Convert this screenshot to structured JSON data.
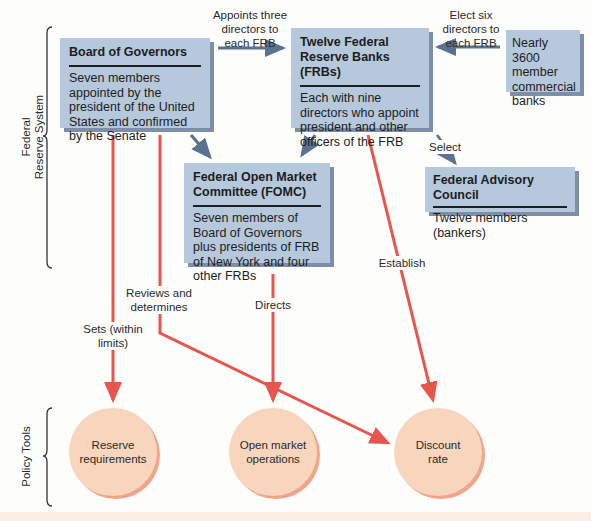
{
  "brackets": {
    "federal_reserve_system": {
      "line1": "Federal",
      "line2": "Reserve System"
    },
    "policy_tools": "Policy Tools"
  },
  "boxes": {
    "board_of_governors": {
      "title": "Board of Governors",
      "description": "Seven members appointed by the president of the United States and confirmed by the Senate"
    },
    "frbs": {
      "title": "Twelve Federal Reserve Banks (FRBs)",
      "description": "Each with nine directors who appoint president and other officers of the FRB"
    },
    "member_banks": {
      "description": "Nearly 3600 member commercial banks"
    },
    "fomc": {
      "title": "Federal Open Market Committee (FOMC)",
      "description": "Seven members of Board of Governors plus presidents of FRB of New York and four other FRBs"
    },
    "advisory_council": {
      "title": "Federal Advisory Council",
      "description": "Twelve members (bankers)"
    }
  },
  "edge_labels": {
    "appoints": "Appoints three directors to each FRB",
    "elect": "Elect six directors to each FRB",
    "select": "Select",
    "establish": "Establish",
    "reviews": "Reviews and determines",
    "directs": "Directs",
    "sets": "Sets (within limits)"
  },
  "policy_tools": [
    {
      "label": "Reserve requirements"
    },
    {
      "label": "Open market operations"
    },
    {
      "label": "Discount rate"
    }
  ],
  "colors": {
    "box_fill": "#b5c8dc",
    "box_shadow": "#7d8fa8",
    "arrow_blue": "#5b7190",
    "arrow_red": "#e8554d",
    "circle_fill": "#f8d5bd",
    "circle_shadow": "#f0a58a"
  }
}
